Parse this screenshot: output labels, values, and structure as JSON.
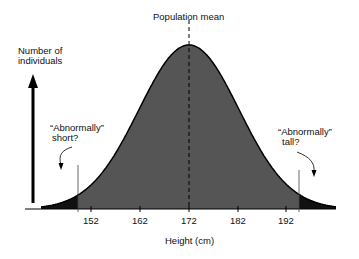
{
  "title": "Population mean",
  "y_axis_label": [
    "Number of",
    "individuals"
  ],
  "x_axis_label": "Height (cm)",
  "annotations": {
    "short": [
      "“Abnormally”",
      "short?"
    ],
    "tall": [
      "“Abnormally”",
      "tall?"
    ]
  },
  "ticks": [
    "152",
    "162",
    "172",
    "182",
    "192"
  ],
  "colors": {
    "body": "#555555",
    "tails": "#111111",
    "line": "#000000"
  },
  "chart_data": {
    "type": "area",
    "title": "Population mean",
    "xlabel": "Height (cm)",
    "ylabel": "Number of individuals",
    "distribution": "normal",
    "mean": 172,
    "x_ticks": [
      152,
      162,
      172,
      182,
      192
    ],
    "shaded_tails": {
      "short_below": 149,
      "tall_above": 194
    },
    "annotations": [
      "Abnormally short?",
      "Abnormally tall?",
      "Population mean"
    ]
  }
}
